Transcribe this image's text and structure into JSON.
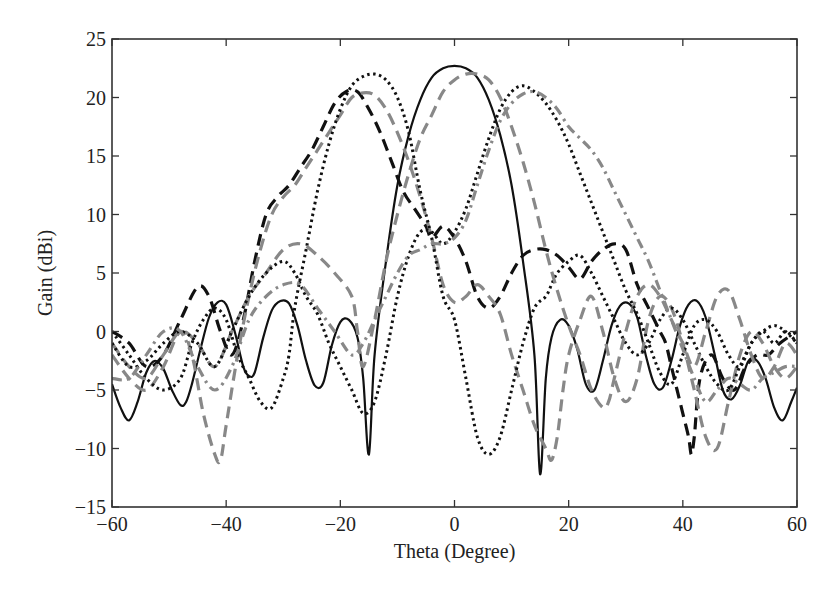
{
  "chart_data": {
    "type": "line",
    "title": "",
    "xlabel": "Theta (Degree)",
    "ylabel": "Gain (dBi)",
    "xlim": [
      -60,
      60
    ],
    "ylim": [
      -15,
      25
    ],
    "xticks": [
      -60,
      -40,
      -20,
      0,
      20,
      40,
      60
    ],
    "yticks": [
      -15,
      -10,
      -5,
      0,
      5,
      10,
      15,
      20,
      25
    ],
    "xtick_labels": [
      "−60",
      "−40",
      "−20",
      "0",
      "20",
      "40",
      "60"
    ],
    "ytick_labels": [
      "−15",
      "−10",
      "−5",
      "0",
      "5",
      "10",
      "15",
      "20",
      "25"
    ],
    "grid": false,
    "legend": null,
    "series": [
      {
        "name": "beam 0° (solid black)",
        "color": "#111111",
        "style": "solid",
        "x": [
          -60,
          -58.5,
          -57,
          -55.5,
          -54,
          -52.5,
          -51,
          -49.5,
          -48,
          -47,
          -46,
          -44.5,
          -43,
          -41.5,
          -40,
          -38.5,
          -37,
          -36,
          -35,
          -33.5,
          -32,
          -30.5,
          -29,
          -27.5,
          -26,
          -24.5,
          -23,
          -21.5,
          -20,
          -18.5,
          -17,
          -16,
          -15,
          -14,
          -12,
          -10,
          -8,
          -6,
          -4,
          -2,
          0,
          2,
          4,
          6,
          8,
          10,
          12,
          14,
          15,
          16,
          17,
          18.5,
          20,
          21.5,
          23,
          24.5,
          26,
          27.5,
          29,
          30.5,
          32,
          33.5,
          35,
          36.5,
          38,
          39.5,
          41,
          42.5,
          44,
          45.5,
          47,
          48.5,
          50,
          51.5,
          53,
          54.5,
          56,
          57.5,
          59,
          60
        ],
        "y": [
          -4.5,
          -6.5,
          -7.6,
          -6,
          -3.5,
          -2.5,
          -3.2,
          -5,
          -6.3,
          -6,
          -4.5,
          -1.5,
          1.2,
          2.5,
          2.3,
          0,
          -3,
          -3.8,
          -3.5,
          -0.5,
          1.8,
          2.6,
          2.4,
          0.5,
          -2.5,
          -4.6,
          -4.4,
          -1.2,
          0.8,
          1.0,
          -0.5,
          -4,
          -10.5,
          -2,
          6,
          12.5,
          16.8,
          19.8,
          21.7,
          22.5,
          22.7,
          22.5,
          21.7,
          19.8,
          16.8,
          12.5,
          6,
          -2,
          -12.2,
          -4,
          -0.5,
          1.0,
          0.5,
          -1.5,
          -4.5,
          -5,
          -2.5,
          0.5,
          2.2,
          2.4,
          1.2,
          -2,
          -4.5,
          -4.8,
          -2.5,
          0.5,
          2.3,
          2.6,
          1.2,
          -1.8,
          -5,
          -5.8,
          -4.6,
          -2.5,
          -2.5,
          -4,
          -6.5,
          -7.6,
          -6,
          -4.8
        ]
      },
      {
        "name": "beam -17° (black dashed)",
        "color": "#111111",
        "style": "dashed",
        "x": [
          -60,
          -57,
          -54,
          -51,
          -48,
          -45,
          -43,
          -41,
          -39,
          -37,
          -35,
          -33,
          -31,
          -29,
          -27,
          -25,
          -23,
          -21,
          -19,
          -17,
          -15,
          -13,
          -11,
          -9,
          -7,
          -5,
          -4,
          -2,
          0,
          2,
          4,
          6,
          8,
          10,
          12,
          14,
          16,
          18,
          20,
          22,
          24,
          26,
          28,
          30,
          32,
          34,
          36,
          37,
          38,
          39,
          40,
          41,
          41.5,
          42,
          43,
          45,
          47,
          49,
          51,
          53,
          55,
          57,
          60
        ],
        "y": [
          0,
          -1,
          -3,
          -2,
          1,
          3.8,
          3,
          0,
          -2,
          1,
          6,
          10,
          11.5,
          12.5,
          14,
          15.5,
          17.5,
          19.5,
          20.5,
          20.5,
          19,
          17,
          14.5,
          12,
          10.5,
          9,
          8,
          9,
          8,
          6,
          3,
          2,
          3,
          5,
          6.5,
          7,
          7,
          6.5,
          5.5,
          4.5,
          6,
          7,
          7.5,
          7,
          4,
          2,
          0,
          -1,
          -3,
          -5,
          -7,
          -9,
          -10.5,
          -9,
          -4,
          -2,
          -4,
          -5,
          -3,
          -2,
          -2,
          -1,
          0
        ]
      },
      {
        "name": "beam -12° (gray dashed)",
        "color": "#888888",
        "style": "dashed",
        "x": [
          -60,
          -57,
          -54,
          -51,
          -48,
          -46,
          -44,
          -42,
          -41,
          -40,
          -38,
          -36,
          -34,
          -32,
          -30,
          -28,
          -26,
          -24,
          -22,
          -20,
          -18,
          -16,
          -14,
          -12,
          -10,
          -8,
          -6,
          -4,
          -2,
          0,
          2,
          4,
          6,
          8,
          10,
          12,
          14,
          16,
          17,
          18,
          19,
          20,
          22,
          24,
          26,
          28,
          30,
          32,
          34,
          36,
          38,
          40,
          42,
          44,
          46,
          48,
          50,
          52,
          54,
          56,
          58,
          60
        ],
        "y": [
          -2,
          -4,
          -5,
          -3,
          0,
          -2,
          -7,
          -10.5,
          -11,
          -8,
          -2,
          3,
          7,
          10,
          11.5,
          12.5,
          14,
          15.5,
          17,
          18.5,
          20,
          20.4,
          20.2,
          19,
          17,
          14.5,
          11.5,
          8,
          4,
          2.5,
          3,
          4,
          3,
          1.5,
          -2,
          -5,
          -8,
          -10,
          -11,
          -9,
          -5,
          -2,
          1,
          3,
          0,
          -4,
          -6,
          -4,
          1,
          3,
          2,
          -1,
          -5,
          -9,
          -10,
          -6,
          -2,
          0,
          -1,
          -3,
          -4,
          -3
        ]
      },
      {
        "name": "beam -7° (black dotted)",
        "color": "#111111",
        "style": "dotted",
        "x": [
          -60,
          -57,
          -54,
          -51,
          -48,
          -46,
          -44,
          -42,
          -40,
          -38,
          -36,
          -34,
          -32,
          -30,
          -29,
          -28,
          -26,
          -24,
          -22,
          -20,
          -18,
          -16,
          -14,
          -12,
          -10,
          -8,
          -6,
          -4,
          -2,
          0,
          2,
          4,
          6,
          8,
          10,
          12,
          14,
          16,
          17,
          18,
          20,
          22,
          24,
          26,
          28,
          30,
          32,
          34,
          36,
          38,
          40,
          42,
          44,
          46,
          48,
          50,
          52,
          54,
          56,
          58,
          60
        ],
        "y": [
          0,
          -2,
          -4,
          -5,
          -4,
          -1,
          1,
          2,
          1,
          -2,
          -4,
          -6,
          -6.5,
          -4,
          -2,
          2,
          7,
          12,
          16,
          19,
          21,
          21.8,
          22,
          21.5,
          20,
          17,
          12,
          8,
          3,
          1,
          -4,
          -9,
          -10.5,
          -9,
          -5,
          -1,
          2,
          3,
          4,
          5,
          6,
          6.5,
          5,
          3,
          1,
          -1,
          -2,
          -1,
          1,
          2,
          1,
          -1,
          -3,
          -4.5,
          -5,
          -3,
          -1,
          0,
          -1,
          0,
          -1
        ]
      },
      {
        "name": "beam +7° (gray dashed)",
        "color": "#888888",
        "style": "dashed",
        "x": [
          -60,
          -57,
          -54,
          -51,
          -48,
          -45,
          -42,
          -39,
          -36,
          -33,
          -30,
          -27,
          -24,
          -21,
          -18,
          -17,
          -16,
          -14,
          -12,
          -10,
          -8,
          -6,
          -4,
          -2,
          0,
          2,
          4,
          6,
          8,
          10,
          12,
          14,
          16,
          18,
          20,
          22,
          24,
          26,
          27,
          28,
          30,
          32,
          34,
          36,
          38,
          40,
          42,
          44,
          46,
          48,
          50,
          52,
          54,
          56,
          58,
          60
        ],
        "y": [
          -1,
          -3,
          -4,
          -2,
          0,
          -1,
          -3,
          0,
          3,
          5,
          7,
          7.5,
          6.5,
          5,
          3,
          0,
          -3,
          1,
          6,
          10,
          13.5,
          16.5,
          18.5,
          20.5,
          21.5,
          22,
          22,
          21.5,
          20,
          17.5,
          14.5,
          11,
          7,
          3.5,
          0.5,
          -2,
          -5,
          -6.5,
          -6,
          -4,
          0,
          3,
          4,
          3,
          1,
          -1,
          -3,
          0,
          3,
          3.5,
          1,
          -2,
          -4,
          -3,
          -1,
          -2
        ]
      },
      {
        "name": "beam +12° (black dotted)",
        "color": "#111111",
        "style": "dotted",
        "x": [
          -60,
          -57,
          -54,
          -51,
          -48,
          -45,
          -42,
          -39,
          -36,
          -33,
          -30,
          -28,
          -26,
          -24,
          -22,
          -20,
          -18,
          -16,
          -14,
          -12,
          -10,
          -8,
          -6,
          -4,
          -2,
          0,
          2,
          4,
          6,
          8,
          10,
          12,
          14,
          16,
          18,
          20,
          22,
          24,
          26,
          28,
          30,
          32,
          34,
          36,
          38,
          40,
          42,
          44,
          46,
          48,
          50,
          52,
          54,
          56,
          58,
          60
        ],
        "y": [
          -1,
          -3,
          -2.5,
          -1,
          0,
          -1,
          -3,
          0,
          3,
          5,
          6,
          5,
          3,
          1.5,
          -1,
          -3,
          -5,
          -7,
          -6,
          -2,
          3,
          6.5,
          8.5,
          8.5,
          7.5,
          8.5,
          10.5,
          13.5,
          16.5,
          19,
          20.5,
          21,
          20.5,
          19.5,
          18,
          16,
          13.5,
          11,
          8.5,
          6,
          3.5,
          1.5,
          -1,
          -3.5,
          -4.5,
          -2,
          0.5,
          1,
          0,
          -2,
          -3,
          -1,
          0,
          0.5,
          0,
          -1
        ]
      },
      {
        "name": "beam +13° (gray dash-dot)",
        "color": "#888888",
        "style": "dashdot",
        "x": [
          -60,
          -57,
          -54,
          -51,
          -48,
          -45,
          -42,
          -39,
          -36,
          -33,
          -30,
          -27,
          -24,
          -21,
          -18,
          -16,
          -14,
          -12,
          -10,
          -8,
          -6,
          -4,
          -2,
          0,
          2,
          4,
          6,
          8,
          10,
          12,
          14,
          16,
          18,
          20,
          22,
          24,
          26,
          28,
          30,
          32,
          34,
          36,
          38,
          40,
          42,
          44,
          46,
          48,
          50,
          52,
          54,
          56,
          58,
          60
        ],
        "y": [
          -4,
          -4,
          -2,
          0,
          0,
          -3,
          -5,
          -3,
          1,
          3,
          4,
          4,
          2,
          0,
          -2,
          -1,
          1,
          3,
          5,
          6.5,
          7,
          7.5,
          7.5,
          8,
          9.5,
          12.5,
          15.5,
          18,
          19.5,
          20.3,
          20.5,
          20,
          19,
          17.5,
          16.5,
          15.5,
          14,
          12,
          10,
          8,
          6,
          3.5,
          1,
          -1.5,
          -4,
          -6,
          -5,
          -4,
          -4.5,
          -5,
          -4,
          -3.5,
          -3,
          -3
        ]
      }
    ]
  }
}
